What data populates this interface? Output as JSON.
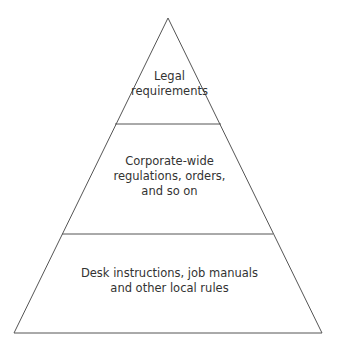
{
  "diagram": {
    "type": "pyramid",
    "line_color": "#555555",
    "text_color": "#333333",
    "tiers": [
      {
        "level": "top",
        "lines": [
          "Legal",
          "requirements"
        ]
      },
      {
        "level": "middle",
        "lines": [
          "Corporate-wide",
          "regulations, orders,",
          "and so on"
        ]
      },
      {
        "level": "bottom",
        "lines": [
          "Desk instructions, job manuals",
          "and other local rules"
        ]
      }
    ]
  }
}
